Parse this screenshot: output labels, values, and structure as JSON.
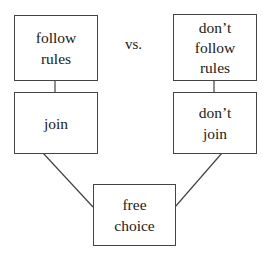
{
  "diagram": {
    "left_top": {
      "lines": [
        "follow",
        "rules"
      ]
    },
    "left_bottom": {
      "lines": [
        "join"
      ]
    },
    "center_label": "vs.",
    "right_top": {
      "lines": [
        "don’t",
        "follow",
        "rules"
      ]
    },
    "right_bottom": {
      "lines": [
        "don’t",
        "join"
      ]
    },
    "bottom": {
      "lines": [
        "free",
        "choice"
      ]
    }
  },
  "colors": {
    "line": "#444444",
    "text": "#1a1a1a",
    "background": "#ffffff"
  }
}
